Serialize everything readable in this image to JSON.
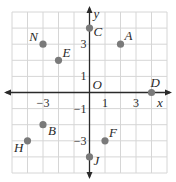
{
  "chart_data": {
    "type": "scatter",
    "title": "",
    "xlabel": "x",
    "ylabel": "y",
    "origin_label": "O",
    "xlim": [
      -5,
      5
    ],
    "ylim": [
      -5,
      5
    ],
    "grid": true,
    "x_ticks": [
      {
        "value": -3,
        "label": "−3"
      },
      {
        "value": 1,
        "label": "1"
      },
      {
        "value": 3,
        "label": "3"
      }
    ],
    "y_ticks": [
      {
        "value": 3,
        "label": "3"
      },
      {
        "value": 1,
        "label": "1"
      },
      {
        "value": -1,
        "label": "−1"
      },
      {
        "value": -3,
        "label": "−3"
      }
    ],
    "points": [
      {
        "name": "A",
        "x": 2,
        "y": 3
      },
      {
        "name": "B",
        "x": -3,
        "y": -2
      },
      {
        "name": "C",
        "x": 0,
        "y": 4
      },
      {
        "name": "D",
        "x": 4,
        "y": 0
      },
      {
        "name": "E",
        "x": -2,
        "y": 2
      },
      {
        "name": "F",
        "x": 1,
        "y": -3
      },
      {
        "name": "H",
        "x": -4,
        "y": -3
      },
      {
        "name": "J",
        "x": 0,
        "y": -4
      },
      {
        "name": "N",
        "x": -3,
        "y": 3
      }
    ],
    "colors": {
      "grid": "#d6d6d6",
      "axis": "#2a2a2a",
      "point": "#7a7a7a"
    }
  }
}
